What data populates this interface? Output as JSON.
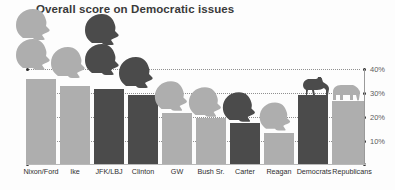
{
  "chart_data": {
    "type": "bar",
    "title": "Overall score on Democratic issues",
    "xlabel": "",
    "ylabel": "",
    "ylim": [
      0,
      44
    ],
    "grid": true,
    "legend": "none",
    "ytick_labels": [
      "40%",
      "30%",
      "20%",
      "10%"
    ],
    "ytick_values": [
      40,
      30,
      20,
      10
    ],
    "categories": [
      "Nixon/Ford",
      "Ike",
      "JFK/LBJ",
      "Clinton",
      "GW",
      "Bush Sr.",
      "Carter",
      "Reagan",
      "Democrats",
      "Republicans"
    ],
    "values": [
      36,
      33,
      31.5,
      29,
      21.5,
      19.5,
      17.5,
      13.5,
      29,
      26.5
    ],
    "series": [
      {
        "name": "Overall score on Democratic issues",
        "values": [
          36,
          33,
          31.5,
          29,
          21.5,
          19.5,
          17.5,
          13.5,
          29,
          26.5
        ]
      }
    ],
    "bar_colors": [
      "#aeaeae",
      "#aeaeae",
      "#4b4b4b",
      "#4b4b4b",
      "#aeaeae",
      "#aeaeae",
      "#4b4b4b",
      "#aeaeae",
      "#4b4b4b",
      "#aeaeae"
    ],
    "annotations": [
      {
        "category": "Nixon/Ford",
        "icon": "two-president-head-silhouettes",
        "color": "#aeaeae"
      },
      {
        "category": "Ike",
        "icon": "president-head-silhouette",
        "color": "#aeaeae"
      },
      {
        "category": "JFK/LBJ",
        "icon": "two-president-head-silhouettes",
        "color": "#4b4b4b"
      },
      {
        "category": "Clinton",
        "icon": "president-head-silhouette",
        "color": "#4b4b4b"
      },
      {
        "category": "GW",
        "icon": "president-head-silhouette",
        "color": "#aeaeae"
      },
      {
        "category": "Bush Sr.",
        "icon": "president-head-silhouette",
        "color": "#aeaeae"
      },
      {
        "category": "Carter",
        "icon": "president-head-silhouette",
        "color": "#4b4b4b"
      },
      {
        "category": "Reagan",
        "icon": "president-head-silhouette",
        "color": "#aeaeae"
      },
      {
        "category": "Democrats",
        "icon": "donkey-silhouette",
        "color": "#4b4b4b"
      },
      {
        "category": "Republicans",
        "icon": "elephant-silhouette",
        "color": "#aeaeae"
      }
    ]
  },
  "colors": {
    "light_gray": "#aeaeae",
    "dark_gray": "#4b4b4b",
    "title_text": "#3a3a3a",
    "tick_text": "#5c5c5c",
    "label_text": "#2e2e2e",
    "gridline": "#7d7d7d",
    "background": "#fdfdfd"
  },
  "axis": {
    "ytick_0": "40%",
    "ytick_1": "30%",
    "ytick_2": "20%",
    "ytick_3": "10%"
  },
  "bars": [
    {
      "label": "Nixon/Ford",
      "value": 36
    },
    {
      "label": "Ike",
      "value": 33
    },
    {
      "label": "JFK/LBJ",
      "value": 31.5
    },
    {
      "label": "Clinton",
      "value": 29
    },
    {
      "label": "GW",
      "value": 21.5
    },
    {
      "label": "Bush Sr.",
      "value": 19.5
    },
    {
      "label": "Carter",
      "value": 17.5
    },
    {
      "label": "Reagan",
      "value": 13.5
    },
    {
      "label": "Democrats",
      "value": 29
    },
    {
      "label": "Republicans",
      "value": 26.5
    }
  ]
}
